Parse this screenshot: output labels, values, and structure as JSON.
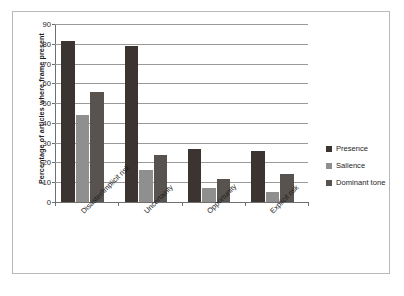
{
  "chart_data": {
    "type": "bar",
    "title": "",
    "subtitle": "",
    "xlabel": "",
    "ylabel": "Percentage of articles where frame present",
    "ylim": [
      0,
      90
    ],
    "ytick_step": 10,
    "yticks": [
      90,
      80,
      70,
      60,
      50,
      40,
      30,
      20,
      10,
      0
    ],
    "grid": true,
    "grid_axis": "y",
    "legend_position": "right",
    "categories": [
      "Disaster/implicit risk",
      "Uncertainty",
      "Opportunity",
      "Explicit risk"
    ],
    "series": [
      {
        "name": "Presence",
        "color": "#3b3430",
        "values": [
          81.5,
          79.0,
          27.0,
          26.0
        ]
      },
      {
        "name": "Salience",
        "color": "#8f8f8f",
        "values": [
          44.0,
          16.0,
          7.0,
          5.0
        ]
      },
      {
        "name": "Dominant tone",
        "color": "#59534f",
        "values": [
          55.5,
          24.0,
          11.5,
          14.0
        ]
      }
    ]
  },
  "figure": {
    "caption_fragment": ""
  }
}
